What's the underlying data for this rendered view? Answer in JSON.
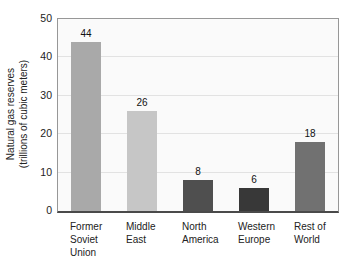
{
  "chart_data": {
    "type": "bar",
    "title": "",
    "categories": [
      "Former Soviet Union",
      "Middle East",
      "North America",
      "Western Europe",
      "Rest of World"
    ],
    "category_lines": [
      [
        "Former",
        "Soviet",
        "Union"
      ],
      [
        "Middle",
        "East"
      ],
      [
        "North",
        "America"
      ],
      [
        "Western",
        "Europe"
      ],
      [
        "Rest of",
        "World"
      ]
    ],
    "values": [
      44,
      26,
      8,
      6,
      18
    ],
    "bar_colors": [
      "#a9a9a9",
      "#c6c6c6",
      "#4f4f4f",
      "#383838",
      "#717171"
    ],
    "ylabel_line1": "Natural gas reserves",
    "ylabel_line2": "(trillions of cubic meters)",
    "xlabel": "",
    "yticks": [
      0,
      10,
      20,
      30,
      40,
      50
    ],
    "ylim": [
      0,
      50
    ],
    "grid": "horizontal",
    "legend": "none"
  },
  "colors": {
    "page_bg": "#ffffff",
    "plot_bg": "#fafafa",
    "gridline": "#e2e2e2",
    "frame": "#979797",
    "baseline": "#4a4a4a",
    "text": "#222222"
  }
}
